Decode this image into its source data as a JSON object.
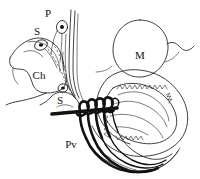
{
  "figure": {
    "background_color": "#ffffff",
    "ink_color": "#111111",
    "style": "hand-drawn black ink line drawing, no shading, white background",
    "width": 200,
    "height": 179
  },
  "labels": [
    {
      "id": "p",
      "text": "P",
      "x": 48,
      "y": 14,
      "description": "label for small oval cell body at upper area"
    },
    {
      "id": "s1",
      "text": "S",
      "x": 37,
      "y": 32,
      "description": "label for upper-left small oval cell with dark nucleus"
    },
    {
      "id": "ch",
      "text": "Ch",
      "x": 39,
      "y": 76,
      "description": "label for large rounded chamber at left"
    },
    {
      "id": "s2",
      "text": "S",
      "x": 60,
      "y": 101,
      "description": "label for second small structure below the chamber"
    },
    {
      "id": "pv",
      "text": "Pv",
      "x": 71,
      "y": 145,
      "description": "label for strand bundle at lower left of the large organ"
    },
    {
      "id": "m",
      "text": "M",
      "x": 140,
      "y": 56,
      "description": "label inside the large circular body at upper right"
    }
  ],
  "structures": [
    {
      "id": "m-circle",
      "name": "large circular body M",
      "kind": "closed-oval"
    },
    {
      "id": "ch-chamber",
      "name": "rounded chamber Ch",
      "kind": "closed-outline"
    },
    {
      "id": "cell-s1",
      "name": "small oval cell with nucleus S",
      "kind": "oval-with-dot"
    },
    {
      "id": "cell-p",
      "name": "small oval cell with nucleus P",
      "kind": "oval-with-dot"
    },
    {
      "id": "cell-s2",
      "name": "small oval cell with nucleus S2",
      "kind": "oval-with-dot"
    },
    {
      "id": "duct-bundle",
      "name": "vertical duct bundle",
      "kind": "parallel-lines"
    },
    {
      "id": "coil-knot",
      "name": "thick dark coiled knot",
      "kind": "heavy-loops"
    },
    {
      "id": "main-organ",
      "name": "large comma-shaped organ",
      "kind": "hatched-sac"
    },
    {
      "id": "organ-hatching",
      "name": "interior serrated hatching",
      "kind": "zigzag-fill"
    },
    {
      "id": "pv-strands",
      "name": "flowing strand bundle Pv",
      "kind": "curved-strands"
    }
  ]
}
